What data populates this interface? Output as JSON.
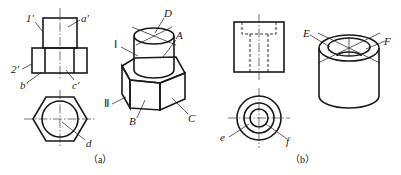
{
  "figure": {
    "panel_a": {
      "caption": "（a）",
      "front_view_labels": {
        "one_prime": "1′",
        "a_prime": "a′",
        "two_prime": "2′",
        "b_prime": "b′",
        "c_prime": "c′"
      },
      "top_view_labels": {
        "d": "d"
      },
      "isometric_labels": {
        "D": "D",
        "I": "Ⅰ",
        "A": "A",
        "II": "Ⅱ",
        "B": "B",
        "C": "C"
      }
    },
    "panel_b": {
      "caption": "（b）",
      "top_view_labels": {
        "e": "e",
        "f": "f"
      },
      "isometric_labels": {
        "E": "E",
        "F": "F"
      }
    }
  }
}
